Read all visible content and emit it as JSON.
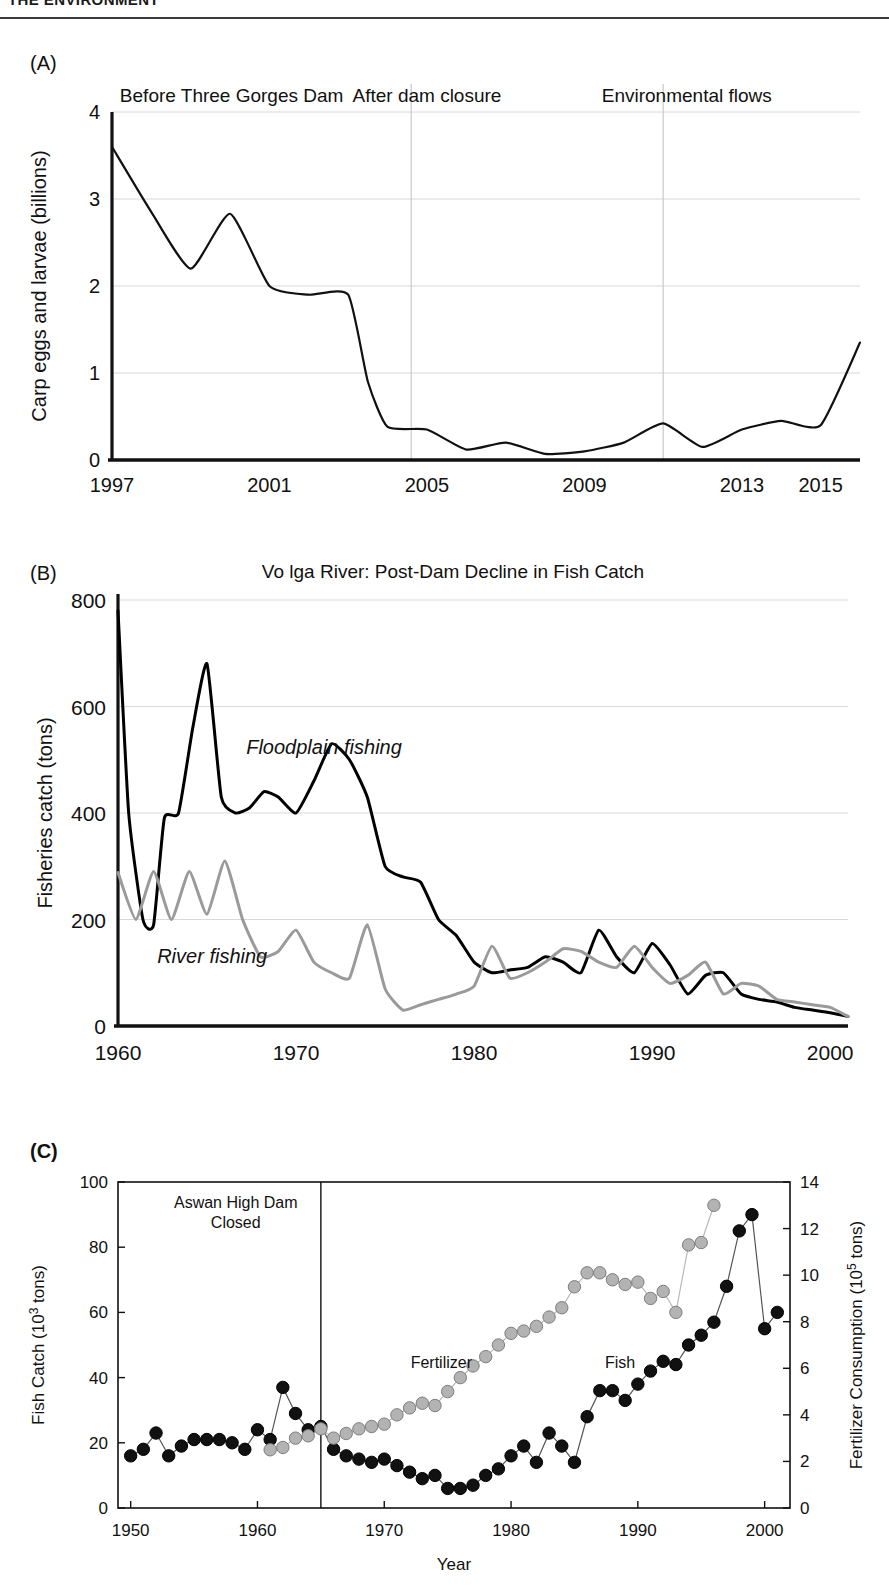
{
  "running_header": "THE ENVIRONMENT",
  "panels": [
    {
      "tag": "(A)"
    },
    {
      "tag": "(B)"
    },
    {
      "tag": "(C)"
    }
  ],
  "chart_data": [
    {
      "type": "line",
      "panel": "(A)",
      "title": "",
      "xlabel": "",
      "ylabel": "Carp eggs and larvae (billions)",
      "xlim": [
        1997,
        2016
      ],
      "ylim": [
        0,
        4
      ],
      "xticks": [
        1997,
        2001,
        2005,
        2009,
        2013,
        2015
      ],
      "yticks": [
        0,
        1,
        2,
        3,
        4
      ],
      "grid": true,
      "annotations": [
        {
          "text": "Before Three Gorges Dam",
          "x": 1997.2
        },
        {
          "text": "After dam closure",
          "x": 2005.0
        },
        {
          "text": "Environmental flows",
          "x": 2011.6
        }
      ],
      "period_dividers": [
        2004.6,
        2011.0
      ],
      "x": [
        1997,
        1998,
        1999,
        2000,
        2001,
        2002,
        2003,
        2003.5,
        2004,
        2005,
        2006,
        2007,
        2008,
        2009,
        2010,
        2011,
        2012,
        2013,
        2014,
        2015,
        2016
      ],
      "values": [
        3.6,
        2.85,
        2.2,
        2.83,
        2.0,
        1.9,
        1.9,
        0.9,
        0.38,
        0.35,
        0.12,
        0.2,
        0.07,
        0.1,
        0.2,
        0.42,
        0.15,
        0.35,
        0.45,
        0.4,
        1.35
      ]
    },
    {
      "type": "line",
      "panel": "(B)",
      "title": "Vo lga River: Post-Dam Decline in Fish Catch",
      "xlabel": "",
      "ylabel": "Fisheries catch (tons)",
      "xlim": [
        1960,
        2001
      ],
      "ylim": [
        0,
        800
      ],
      "xticks": [
        1960,
        1970,
        1980,
        1990,
        2000
      ],
      "yticks": [
        0,
        200,
        400,
        600,
        800
      ],
      "grid": true,
      "series": [
        {
          "name": "Floodplain fishing",
          "color": "#000000",
          "x": [
            1960,
            1960.6,
            1961.4,
            1962,
            1962.6,
            1963.4,
            1964.2,
            1965,
            1965.8,
            1966.6,
            1967.4,
            1968.2,
            1969,
            1970,
            1971,
            1972,
            1973,
            1974,
            1975,
            1976,
            1977,
            1978,
            1979,
            1980,
            1981,
            1982,
            1983,
            1984,
            1985,
            1986,
            1987,
            1988,
            1989,
            1990,
            1991,
            1992,
            1993,
            1994,
            1995,
            1996,
            1997,
            1998,
            1999,
            2000,
            2001
          ],
          "values": [
            780,
            400,
            200,
            190,
            390,
            400,
            560,
            680,
            430,
            400,
            410,
            440,
            430,
            400,
            460,
            530,
            500,
            430,
            300,
            280,
            270,
            200,
            170,
            120,
            100,
            105,
            110,
            130,
            120,
            100,
            180,
            130,
            100,
            155,
            115,
            60,
            95,
            100,
            60,
            50,
            45,
            35,
            30,
            25,
            18
          ]
        },
        {
          "name": "River fishing",
          "color": "#9a9a9a",
          "x": [
            1960,
            1961,
            1962,
            1963,
            1964,
            1965,
            1966,
            1967,
            1968,
            1969,
            1970,
            1971,
            1972,
            1973,
            1974,
            1975,
            1976,
            1977,
            1978,
            1979,
            1980,
            1981,
            1982,
            1983,
            1984,
            1985,
            1986,
            1987,
            1988,
            1989,
            1990,
            1991,
            1992,
            1993,
            1994,
            1995,
            1996,
            1997,
            1998,
            1999,
            2000,
            2001
          ],
          "values": [
            288,
            200,
            290,
            200,
            290,
            210,
            310,
            200,
            130,
            140,
            180,
            120,
            100,
            90,
            190,
            70,
            30,
            40,
            50,
            60,
            75,
            150,
            90,
            100,
            120,
            145,
            140,
            120,
            110,
            150,
            110,
            80,
            95,
            120,
            60,
            80,
            75,
            50,
            45,
            40,
            35,
            18
          ]
        }
      ]
    },
    {
      "type": "scatter",
      "panel": "(C)",
      "title": "",
      "xlabel": "Year",
      "ylabel": "Fish Catch (10³ tons)",
      "ylabel_right": "Fertilizer Consumption (10⁵ tons)",
      "xlim": [
        1949,
        2002
      ],
      "ylim": [
        0,
        100
      ],
      "ylim_right": [
        0,
        14
      ],
      "xticks": [
        1950,
        1960,
        1970,
        1980,
        1990,
        2000
      ],
      "yticks": [
        0,
        20,
        40,
        60,
        80,
        100
      ],
      "yticks_right": [
        0,
        2,
        4,
        6,
        8,
        10,
        12,
        14
      ],
      "grid": false,
      "annotations": [
        {
          "text": "Aswan High Dam",
          "line2": "Closed"
        },
        {
          "text": "Fertilizer"
        },
        {
          "text": "Fish"
        }
      ],
      "event_line_x": 1965,
      "series": [
        {
          "name": "Fish",
          "color": "#111111",
          "axis": "left",
          "x": [
            1950,
            1951,
            1952,
            1953,
            1954,
            1955,
            1956,
            1957,
            1958,
            1959,
            1960,
            1961,
            1962,
            1963,
            1964,
            1965,
            1966,
            1967,
            1968,
            1969,
            1970,
            1971,
            1972,
            1973,
            1974,
            1975,
            1976,
            1977,
            1978,
            1979,
            1980,
            1981,
            1982,
            1983,
            1984,
            1985,
            1986,
            1987,
            1988,
            1989,
            1990,
            1991,
            1992,
            1993,
            1994,
            1995,
            1996,
            1997,
            1998,
            1999,
            2000,
            2001
          ],
          "values": [
            16,
            18,
            23,
            16,
            19,
            21,
            21,
            21,
            20,
            18,
            24,
            21,
            37,
            29,
            24,
            25,
            18,
            16,
            15,
            14,
            15,
            13,
            11,
            9,
            10,
            6,
            6,
            7,
            10,
            12,
            16,
            19,
            14,
            23,
            19,
            14,
            28,
            36,
            36,
            33,
            38,
            42,
            45,
            44,
            50,
            53,
            57,
            68,
            85,
            90,
            55,
            60
          ]
        },
        {
          "name": "Fertilizer",
          "color": "#b3b3b3",
          "axis": "right",
          "x": [
            1961,
            1962,
            1963,
            1964,
            1965,
            1966,
            1967,
            1968,
            1969,
            1970,
            1971,
            1972,
            1973,
            1974,
            1975,
            1976,
            1977,
            1978,
            1979,
            1980,
            1981,
            1982,
            1983,
            1984,
            1985,
            1986,
            1987,
            1988,
            1989,
            1990,
            1991,
            1992,
            1993,
            1994,
            1995,
            1996
          ],
          "values": [
            2.5,
            2.6,
            3.0,
            3.1,
            3.4,
            3.0,
            3.2,
            3.4,
            3.5,
            3.6,
            4.0,
            4.3,
            4.5,
            4.4,
            5.0,
            5.6,
            6.1,
            6.5,
            7.0,
            7.5,
            7.6,
            7.8,
            8.2,
            8.6,
            9.5,
            10.1,
            10.1,
            9.8,
            9.6,
            9.7,
            9.0,
            9.3,
            8.4,
            11.3,
            11.4,
            13.0
          ]
        }
      ]
    }
  ]
}
